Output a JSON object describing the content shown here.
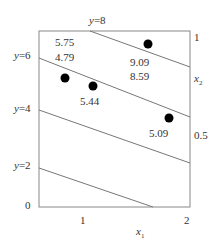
{
  "diagram": {
    "type": "contour-plot",
    "axes": {
      "x_label": "x",
      "x_label_sub": "1",
      "y_label": "x",
      "y_label_sub": "2",
      "x_ticks": [
        "1",
        "2"
      ],
      "y_ticks_right": [
        "1",
        "0.5"
      ],
      "origin_label": "0"
    },
    "contours": [
      {
        "label": "y=8"
      },
      {
        "label": "y=6"
      },
      {
        "label": "y=4"
      },
      {
        "label": "y=2"
      }
    ],
    "value_labels": [
      {
        "text": "5.75"
      },
      {
        "text": "4.79"
      },
      {
        "text": "9.09"
      },
      {
        "text": "8.59"
      },
      {
        "text": "5.44"
      },
      {
        "text": "5.09"
      }
    ],
    "points": 4,
    "colors": {
      "line": "#777777",
      "dot": "#000000",
      "text": "#333333"
    }
  }
}
